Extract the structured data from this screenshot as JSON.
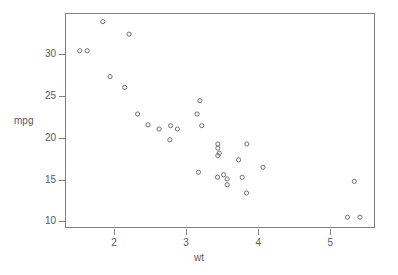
{
  "chart_data": {
    "type": "scatter",
    "title": "",
    "xlabel": "wt",
    "ylabel": "mpg",
    "xlim": [
      1.32,
      5.62
    ],
    "ylim": [
      9.22,
      34.82
    ],
    "xticks": [
      2,
      3,
      4,
      5
    ],
    "xtick_labels": [
      "2",
      "3",
      "4",
      "5"
    ],
    "yticks": [
      10,
      15,
      20,
      25,
      30
    ],
    "ytick_labels": [
      "10",
      "15",
      "20",
      "25",
      "30"
    ],
    "grid": false,
    "legend": "none",
    "marker": "open-circle",
    "marker_color": "#6e6e78",
    "frame_color": "#808080",
    "background": "#ffffff",
    "n_points": 32,
    "series": [
      {
        "name": "mtcars",
        "x": [
          2.62,
          2.875,
          2.32,
          3.215,
          3.44,
          3.46,
          3.57,
          3.19,
          3.15,
          3.44,
          3.44,
          4.07,
          3.73,
          3.78,
          5.25,
          5.424,
          5.345,
          2.2,
          1.615,
          1.835,
          2.465,
          3.52,
          3.435,
          3.84,
          3.845,
          1.935,
          2.14,
          1.513,
          3.17,
          2.77,
          3.57,
          2.78
        ],
        "y": [
          21.0,
          21.0,
          22.8,
          21.4,
          18.7,
          18.1,
          14.3,
          24.4,
          22.8,
          19.2,
          17.8,
          16.4,
          17.3,
          15.2,
          10.4,
          10.4,
          14.7,
          32.4,
          30.4,
          33.9,
          21.5,
          15.5,
          15.2,
          13.3,
          19.2,
          27.3,
          26.0,
          30.4,
          15.8,
          19.7,
          15.0,
          21.4
        ]
      }
    ]
  },
  "axes": {
    "y_title": "mpg",
    "x_title": "wt"
  }
}
